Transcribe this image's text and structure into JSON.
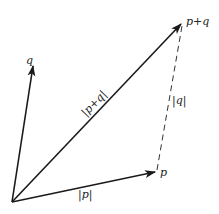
{
  "diagram": {
    "vectors": [
      {
        "id": "p",
        "label": "p",
        "magnitude_label": "|p|"
      },
      {
        "id": "q",
        "label": "q",
        "magnitude_label": "|q|"
      },
      {
        "id": "p_plus_q",
        "label": "p+q",
        "magnitude_label": "|p+q|"
      }
    ],
    "labels": {
      "q_tip": "q",
      "p_tip": "p",
      "sum_tip": "p+q",
      "mag_p": "|p|",
      "mag_q": "|q|",
      "mag_sum": "|p+q|"
    },
    "colors": {
      "line": "#1a1a1a",
      "text": "#222222",
      "background": "#ffffff"
    }
  }
}
